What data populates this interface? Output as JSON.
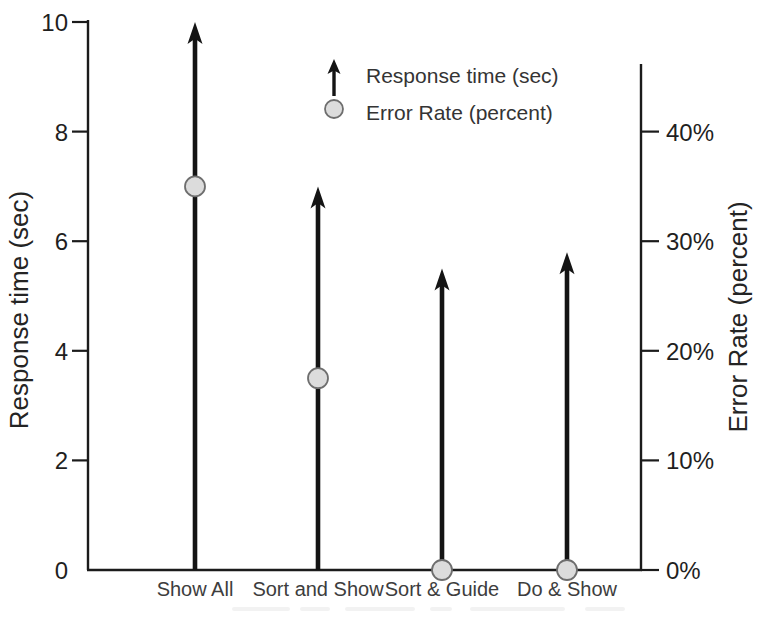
{
  "figure": {
    "background": "#ffffff"
  },
  "chart_data": {
    "type": "combo",
    "categories": [
      "Show All",
      "Sort and Show",
      "Sort & Guide",
      "Do & Show"
    ],
    "series": [
      {
        "name": "Response time (sec)",
        "marker": "arrow",
        "axis": "left",
        "values": [
          10,
          7,
          5.5,
          5.8
        ]
      },
      {
        "name": "Error Rate (percent)",
        "marker": "circle",
        "axis": "right",
        "values": [
          35,
          17.5,
          0,
          0
        ]
      }
    ],
    "left_axis": {
      "label": "Response time (sec)",
      "ticks": [
        0,
        2,
        4,
        6,
        8,
        10
      ],
      "range": [
        0,
        10
      ]
    },
    "right_axis": {
      "label": "Error Rate (percent)",
      "tick_labels": [
        "0%",
        "10%",
        "20%",
        "30%",
        "40%"
      ],
      "tick_values": [
        0,
        10,
        20,
        30,
        40
      ],
      "range": [
        0,
        50
      ]
    },
    "legend": {
      "position": "top-center",
      "entries": [
        {
          "marker": "arrow",
          "label": "Response time (sec)"
        },
        {
          "marker": "circle",
          "label": "Error Rate (percent)"
        }
      ]
    },
    "grid": false,
    "colors": {
      "arrow": "#141414",
      "axis": "#1b1b1b",
      "tick_text": "#1f1f1f",
      "category_text": "#3d3d3d",
      "title_text": "#242424",
      "legend_text": "#343434",
      "dot_fill": "#dcdcdc",
      "dot_stroke": "#6e6e6e"
    }
  }
}
